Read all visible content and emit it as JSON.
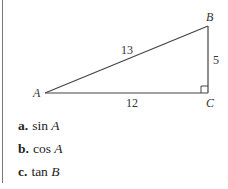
{
  "figure": {
    "vertices": {
      "A": "A",
      "B": "B",
      "C": "C"
    },
    "sides": {
      "AB": "13",
      "AC": "12",
      "BC": "5"
    },
    "right_angle_at": "C"
  },
  "items": [
    {
      "letter": "a.",
      "func": "sin",
      "var": "A"
    },
    {
      "letter": "b.",
      "func": "cos",
      "var": "A"
    },
    {
      "letter": "c.",
      "func": "tan",
      "var": "B"
    }
  ]
}
